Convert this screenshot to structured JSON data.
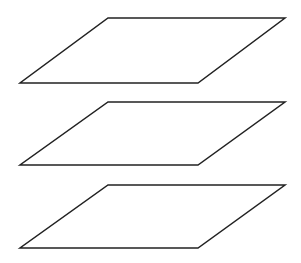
{
  "diagram": {
    "stroke_color": "#222222",
    "fill_color": "#ffffff",
    "planes": [
      {
        "name": "plane-top",
        "points": "108,18 285,18 198,83 20,83"
      },
      {
        "name": "plane-middle",
        "points": "108,102 285,102 198,165 20,165"
      },
      {
        "name": "plane-bottom",
        "points": "108,185 285,185 198,248 20,248"
      }
    ]
  }
}
